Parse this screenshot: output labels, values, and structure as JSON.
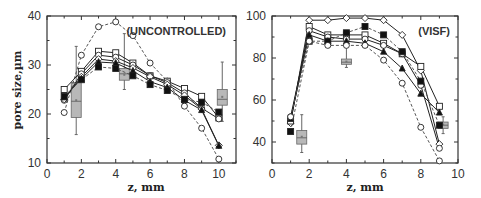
{
  "chart_data": [
    {
      "type": "line",
      "panel": "left",
      "title": "",
      "annotation": "(UNCONTROLLED)",
      "xlabel": "z, mm",
      "ylabel": "pore size,µm",
      "xlim": [
        0,
        11
      ],
      "ylim": [
        10,
        40
      ],
      "xticks": [
        "0",
        "2",
        "4",
        "6",
        "8",
        "10"
      ],
      "yticks": [
        "10",
        "20",
        "30",
        "40"
      ],
      "grid": false,
      "series": [
        {
          "name": "open-circle-dashed",
          "marker": "circle-open",
          "style": "dashed",
          "x": [
            1,
            2,
            3,
            4,
            5,
            6,
            7,
            8,
            9,
            10
          ],
          "values": [
            20.3,
            32,
            37.8,
            38.8,
            36,
            30.4,
            26.7,
            21.6,
            17.1,
            10.8
          ]
        },
        {
          "name": "open-square-1",
          "marker": "square-open",
          "style": "solid",
          "x": [
            1,
            2,
            3,
            4,
            5,
            6,
            7,
            8,
            9,
            10
          ],
          "values": [
            25,
            28.7,
            32.8,
            32.5,
            30.4,
            27.8,
            26.7,
            25.2,
            23.6,
            19.2
          ]
        },
        {
          "name": "open-circle-1",
          "marker": "circle-open",
          "style": "solid",
          "x": [
            1,
            2,
            3,
            4,
            5,
            6,
            7,
            8,
            9,
            10
          ],
          "values": [
            22.8,
            28.2,
            32,
            31.6,
            30,
            27.8,
            26.4,
            24.3,
            21.2,
            19
          ]
        },
        {
          "name": "open-diamond",
          "marker": "diamond-open",
          "style": "solid",
          "x": [
            1,
            2,
            3,
            4,
            5,
            6,
            7,
            8,
            9,
            10
          ],
          "values": [
            23,
            27.6,
            31.2,
            30.8,
            29.4,
            27.6,
            26,
            23.8,
            21,
            13.6
          ]
        },
        {
          "name": "filled-triangle",
          "marker": "triangle-filled",
          "style": "solid",
          "x": [
            1,
            2,
            3,
            4,
            5,
            6,
            7,
            8,
            9,
            10
          ],
          "values": [
            23.4,
            27.2,
            30.6,
            30.4,
            28.8,
            26.6,
            25.4,
            22.8,
            20.8,
            13.5
          ]
        },
        {
          "name": "filled-square-dashed",
          "marker": "square-filled",
          "style": "dashed",
          "x": [
            1,
            2,
            3,
            4,
            5,
            6,
            7,
            8,
            9,
            10
          ],
          "values": [
            23.6,
            27,
            29.6,
            29.3,
            27.8,
            26,
            24.8,
            23,
            22.4,
            20.4
          ]
        }
      ],
      "boxes": [
        {
          "x": 1.7,
          "whisker_low": 15.8,
          "q1": 19.3,
          "median": 22.6,
          "mean": 22.8,
          "q3": 26.4,
          "whisker_high": 33.8
        },
        {
          "x": 4.5,
          "whisker_low": 25,
          "q1": 26.9,
          "median": 28.2,
          "mean": 28,
          "q3": 29.3,
          "whisker_high": 36.4
        },
        {
          "x": 10.2,
          "whisker_low": 18.5,
          "q1": 21.8,
          "median": 23,
          "mean": 23.5,
          "q3": 25,
          "whisker_high": 30.6
        }
      ]
    },
    {
      "type": "line",
      "panel": "right",
      "title": "",
      "annotation": "(VISF)",
      "xlabel": "z, mm",
      "ylabel": "",
      "xlim": [
        0,
        10
      ],
      "ylim": [
        30,
        100
      ],
      "xticks": [
        "0",
        "2",
        "4",
        "6",
        "8",
        "10"
      ],
      "yticks": [
        "40",
        "60",
        "80",
        "100"
      ],
      "grid": false,
      "series": [
        {
          "name": "open-diamond",
          "marker": "diamond-open",
          "style": "solid",
          "x": [
            1,
            2,
            3,
            4,
            5,
            6,
            7,
            8,
            9
          ],
          "values": [
            49,
            98,
            98,
            99,
            99,
            98,
            91,
            74,
            39
          ]
        },
        {
          "name": "open-square",
          "marker": "square-open",
          "style": "solid",
          "x": [
            1,
            2,
            3,
            4,
            5,
            6,
            7,
            8,
            9
          ],
          "values": [
            50,
            95,
            91,
            91,
            91,
            87,
            82,
            76,
            57
          ]
        },
        {
          "name": "open-circle-1",
          "marker": "circle-open",
          "style": "solid",
          "x": [
            1,
            2,
            3,
            4,
            5,
            6,
            7,
            8,
            9
          ],
          "values": [
            52,
            93,
            90,
            89,
            89,
            86,
            82,
            67,
            37
          ]
        },
        {
          "name": "filled-triangle",
          "marker": "triangle-filled",
          "style": "solid",
          "x": [
            1,
            2,
            3,
            4,
            5,
            6,
            7,
            8,
            9
          ],
          "values": [
            51,
            91,
            88,
            88,
            87,
            83,
            75,
            63,
            54
          ]
        },
        {
          "name": "filled-square-dashed",
          "marker": "square-filled",
          "style": "dashed",
          "x": [
            1,
            2,
            3,
            4,
            5,
            6,
            7,
            8,
            9
          ],
          "values": [
            45,
            88,
            88,
            92,
            95,
            91,
            83,
            69,
            48
          ]
        },
        {
          "name": "open-circle-dashed",
          "marker": "circle-open",
          "style": "dashed",
          "x": [
            1,
            2,
            3,
            4,
            5,
            6,
            7,
            8,
            9
          ],
          "values": [
            52,
            88,
            86,
            86,
            86,
            79,
            68,
            47,
            31
          ]
        }
      ],
      "boxes": [
        {
          "x": 1.6,
          "whisker_low": 35,
          "q1": 39,
          "median": 42,
          "mean": 42.5,
          "q3": 45.5,
          "whisker_high": 53
        },
        {
          "x": 4.0,
          "whisker_low": 75.5,
          "q1": 77,
          "median": 78,
          "mean": 78.3,
          "q3": 79.5,
          "whisker_high": 88
        },
        {
          "x": 9.2,
          "whisker_low": 44,
          "q1": 46.5,
          "median": 48,
          "mean": 48.3,
          "q3": 49.5,
          "whisker_high": 52
        }
      ]
    }
  ],
  "panels": {
    "left": {
      "annotation": "(UNCONTROLLED)",
      "xlabel": "z, mm",
      "ylabel": "pore size,µm"
    },
    "right": {
      "annotation": "(VISF)",
      "xlabel": "z, mm"
    }
  }
}
